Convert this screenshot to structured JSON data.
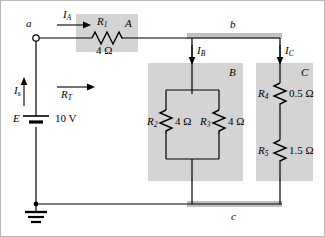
{
  "figure": {
    "type": "electrical-circuit-schematic",
    "background_color": "#ffffff",
    "block_fill_color": "#d4d4d4",
    "wire_color": "#000000",
    "rail_color": "#c0c0c0"
  },
  "source": {
    "symbol": "battery",
    "label": "E",
    "value": "10 V"
  },
  "currents": {
    "source": {
      "label": "I",
      "subscript": "s",
      "direction": "up"
    },
    "branch_a": {
      "label": "I",
      "subscript": "A",
      "direction": "right"
    },
    "branch_b": {
      "label": "I",
      "subscript": "B",
      "direction": "down"
    },
    "branch_c": {
      "label": "I",
      "subscript": "C",
      "direction": "down"
    }
  },
  "total_resistance": {
    "label": "R",
    "subscript": "T",
    "direction": "right"
  },
  "nodes": [
    {
      "name": "a",
      "label": "a",
      "kind": "open-terminal"
    },
    {
      "name": "b",
      "label": "b",
      "kind": "bus-rail"
    },
    {
      "name": "c",
      "label": "c",
      "kind": "bus-rail"
    }
  ],
  "blocks": [
    {
      "name": "A",
      "label": "A",
      "resistors": [
        {
          "name": "R1",
          "label": "R",
          "subscript": "1",
          "value": "4 Ω"
        }
      ]
    },
    {
      "name": "B",
      "label": "B",
      "topology": "parallel",
      "resistors": [
        {
          "name": "R2",
          "label": "R",
          "subscript": "2",
          "value": "4 Ω"
        },
        {
          "name": "R3",
          "label": "R",
          "subscript": "3",
          "value": "4 Ω"
        }
      ]
    },
    {
      "name": "C",
      "label": "C",
      "topology": "series",
      "resistors": [
        {
          "name": "R4",
          "label": "R",
          "subscript": "4",
          "value": "0.5 Ω"
        },
        {
          "name": "R5",
          "label": "R",
          "subscript": "5",
          "value": "1.5 Ω"
        }
      ]
    }
  ],
  "ground": {
    "symbol": "earth-ground",
    "present": true
  }
}
